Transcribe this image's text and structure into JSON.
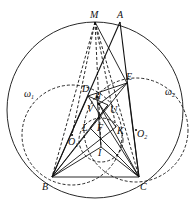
{
  "diagram": {
    "type": "geometry",
    "circumcircle": {
      "cx": 95,
      "cy": 110,
      "r": 88
    },
    "omega1": {
      "label": "ω",
      "sub": "1",
      "cx": 72,
      "cy": 135,
      "r": 50
    },
    "omega2": {
      "label": "ω",
      "sub": "2",
      "cx": 136,
      "cy": 130,
      "r": 52
    },
    "points": [
      {
        "name": "M",
        "x": 95,
        "y": 22,
        "lx": 90,
        "ly": 18
      },
      {
        "name": "A",
        "x": 120,
        "y": 22,
        "lx": 117,
        "ly": 18
      },
      {
        "name": "D",
        "x": 88,
        "y": 96,
        "lx": 82,
        "ly": 92
      },
      {
        "name": "E",
        "x": 127,
        "y": 83,
        "lx": 126,
        "ly": 80
      },
      {
        "name": "H",
        "x": 97,
        "y": 97,
        "lx": 96,
        "ly": 97
      },
      {
        "name": "V",
        "x": 99,
        "y": 104,
        "lx": 87,
        "ly": 111
      },
      {
        "name": "U",
        "x": 108,
        "y": 105,
        "lx": 110,
        "ly": 112
      },
      {
        "name": "L",
        "x": 90,
        "y": 128,
        "lx": 82,
        "ly": 130
      },
      {
        "name": "F",
        "x": 101,
        "y": 126,
        "lx": 97,
        "ly": 130
      },
      {
        "name": "K",
        "x": 116,
        "y": 127,
        "lx": 117,
        "ly": 133
      },
      {
        "name": "O1",
        "x": 72,
        "y": 135,
        "lx": 68,
        "ly": 144
      },
      {
        "name": "O2",
        "x": 136,
        "y": 130,
        "lx": 137,
        "ly": 137
      },
      {
        "name": "I",
        "x": 101,
        "y": 147,
        "lx": 98,
        "ly": 156
      },
      {
        "name": "B",
        "x": 52,
        "y": 177,
        "lx": 42,
        "ly": 190
      },
      {
        "name": "C",
        "x": 139,
        "y": 177,
        "lx": 140,
        "ly": 190
      }
    ]
  }
}
